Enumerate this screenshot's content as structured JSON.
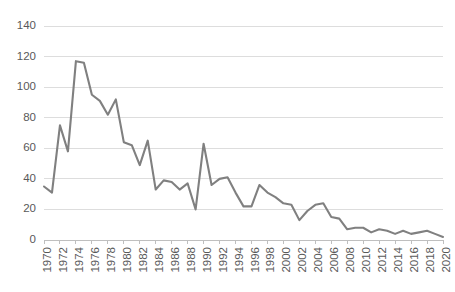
{
  "chart_data": {
    "type": "line",
    "title": "",
    "subtitle": "",
    "xlabel": "",
    "ylabel": "",
    "legend": [],
    "legend_position": "none",
    "grid": "horizontal",
    "xlim": [
      1970,
      2020
    ],
    "ylim": [
      0,
      140
    ],
    "y_ticks": [
      0,
      20,
      40,
      60,
      80,
      100,
      120,
      140
    ],
    "y_tick_labels": [
      "0",
      "20",
      "40",
      "60",
      "80",
      "100",
      "120",
      "140"
    ],
    "x_tick_labels": [
      "1970",
      "1972",
      "1974",
      "1976",
      "1978",
      "1980",
      "1982",
      "1984",
      "1986",
      "1988",
      "1990",
      "1992",
      "1994",
      "1996",
      "1998",
      "2000",
      "2002",
      "2004",
      "2006",
      "2008",
      "2010",
      "2012",
      "2014",
      "2016",
      "2018",
      "2020"
    ],
    "x_tick_rotation": -90,
    "x": [
      1970,
      1971,
      1972,
      1973,
      1974,
      1975,
      1976,
      1977,
      1978,
      1979,
      1980,
      1981,
      1982,
      1983,
      1984,
      1985,
      1986,
      1987,
      1988,
      1989,
      1990,
      1991,
      1992,
      1993,
      1994,
      1995,
      1996,
      1997,
      1998,
      1999,
      2000,
      2001,
      2002,
      2003,
      2004,
      2005,
      2006,
      2007,
      2008,
      2009,
      2010,
      2011,
      2012,
      2013,
      2014,
      2015,
      2016,
      2017,
      2018,
      2019,
      2020
    ],
    "values": [
      35,
      31,
      75,
      58,
      117,
      116,
      95,
      91,
      82,
      92,
      64,
      62,
      49,
      65,
      33,
      39,
      38,
      33,
      37,
      20,
      63,
      36,
      40,
      41,
      31,
      22,
      22,
      36,
      31,
      28,
      24,
      23,
      13,
      19,
      23,
      24,
      15,
      14,
      7,
      8,
      8,
      5,
      7,
      6,
      4,
      6,
      4,
      5,
      6,
      4,
      2
    ],
    "series": [
      {
        "name": "series-1",
        "color": "#808080",
        "values": [
          35,
          31,
          75,
          58,
          117,
          116,
          95,
          91,
          82,
          92,
          64,
          62,
          49,
          65,
          33,
          39,
          38,
          33,
          37,
          20,
          63,
          36,
          40,
          41,
          31,
          22,
          22,
          36,
          31,
          28,
          24,
          23,
          13,
          19,
          23,
          24,
          15,
          14,
          7,
          8,
          8,
          5,
          7,
          6,
          4,
          6,
          4,
          5,
          6,
          4,
          2
        ]
      }
    ]
  },
  "style": {
    "line_color": "#808080",
    "grid_color": "#d9d9d9",
    "axis_color": "#bfbfbf",
    "tick_label_color": "#595959",
    "background": "#ffffff"
  },
  "geometry": {
    "plot_left": 44,
    "plot_right": 443,
    "plot_top": 26,
    "plot_bottom": 240
  }
}
